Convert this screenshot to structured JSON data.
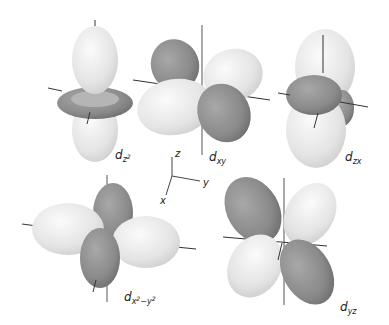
{
  "diagram": {
    "colors": {
      "positive_lobe": "#e6e6e6",
      "negative_lobe": "#8c8c8c",
      "axis_line": "#333333",
      "background": "#ffffff"
    },
    "orbitals": [
      {
        "id": "dz2",
        "symbol": "d",
        "subscript": "z",
        "superscript": "2"
      },
      {
        "id": "dxy",
        "symbol": "d",
        "subscript": "xy"
      },
      {
        "id": "dzx",
        "symbol": "d",
        "subscript": "zx"
      },
      {
        "id": "dx2y2",
        "symbol": "d",
        "subscript_parts": [
          "x",
          "2",
          "−y",
          "2"
        ]
      },
      {
        "id": "dyz",
        "symbol": "d",
        "subscript": "yz"
      }
    ],
    "axes_legend": {
      "z": "z",
      "y": "y",
      "x": "x"
    }
  }
}
